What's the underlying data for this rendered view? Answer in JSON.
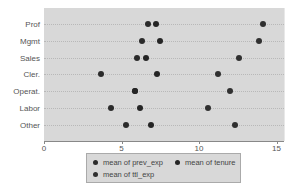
{
  "chart_data": {
    "type": "dot",
    "title": "",
    "xlabel": "",
    "ylabel": "",
    "categories": [
      "Prof",
      "Mgmt",
      "Sales",
      "Cler.",
      "Operat.",
      "Labor",
      "Other"
    ],
    "series": [
      {
        "name": "mean of prev_exp",
        "color": "#2b2b2b",
        "values": [
          6.7,
          6.3,
          6.0,
          3.7,
          5.9,
          4.3,
          5.3
        ]
      },
      {
        "name": "mean of tenure",
        "color": "#252525",
        "values": [
          7.2,
          7.5,
          6.6,
          7.3,
          5.9,
          6.2,
          6.9
        ]
      },
      {
        "name": "mean of ttl_exp",
        "color": "#303030",
        "values": [
          14.1,
          13.9,
          12.6,
          11.2,
          12.0,
          10.6,
          12.3
        ]
      }
    ],
    "xlim": [
      0,
      15.5
    ],
    "xticks": [
      "0",
      "5",
      "10",
      "15"
    ],
    "xtick_values": [
      0,
      5,
      10,
      15
    ],
    "grid": true,
    "legend_position": "bottom"
  },
  "legend": {
    "items": [
      "mean of prev_exp",
      "mean of tenure",
      "mean of ttl_exp"
    ]
  },
  "y_labels": [
    "Prof",
    "Mgmt",
    "Sales",
    "Cler.",
    "Operat.",
    "Labor",
    "Other"
  ],
  "x_labels": [
    "0",
    "5",
    "10",
    "15"
  ],
  "colors": {
    "plot_bg": "#d8d8d8",
    "dot": "#2b2b2b"
  }
}
